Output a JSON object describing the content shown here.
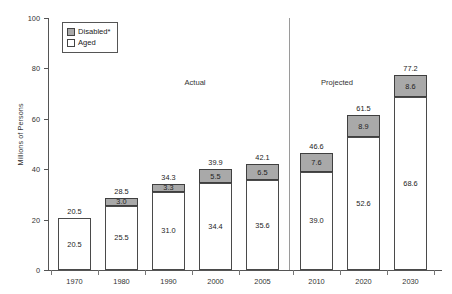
{
  "chart_data": {
    "type": "bar",
    "subtype": "stacked-bar",
    "title": "",
    "xlabel": "",
    "ylabel": "Millions of Persons",
    "ylim": [
      0,
      100
    ],
    "yticks": [
      0,
      20,
      40,
      60,
      80,
      100
    ],
    "grid": false,
    "categories": [
      "1970",
      "1980",
      "1990",
      "2000",
      "2005",
      "2010",
      "2020",
      "2030"
    ],
    "series": [
      {
        "name": "Aged",
        "color": "#ffffff",
        "values": [
          20.5,
          25.5,
          31.0,
          34.4,
          35.6,
          39.0,
          52.6,
          68.6
        ]
      },
      {
        "name": "Disabled*",
        "color": "#a9a9a9",
        "values": [
          null,
          3.0,
          3.3,
          5.5,
          6.5,
          7.6,
          8.9,
          8.6
        ]
      }
    ],
    "totals": [
      20.5,
      28.5,
      34.3,
      39.9,
      42.1,
      46.6,
      61.5,
      77.2
    ],
    "annotations": [
      {
        "text": "Actual",
        "region": "1970-2005"
      },
      {
        "text": "Projected",
        "region": "2010-2030"
      }
    ],
    "legend": {
      "position": "top-left",
      "entries": [
        {
          "label": "Disabled*",
          "color": "#a9a9a9"
        },
        {
          "label": "Aged",
          "color": "#ffffff"
        }
      ]
    },
    "divider": {
      "between": [
        "2005",
        "2010"
      ],
      "label": "actual-projected-divider"
    }
  },
  "axis": {
    "y_title": "Millions of Persons",
    "y_ticks": [
      "0",
      "20",
      "40",
      "60",
      "80",
      "100"
    ],
    "x_ticks": [
      "1970",
      "1980",
      "1990",
      "2000",
      "2005",
      "2010",
      "2020",
      "2030"
    ]
  },
  "sections": {
    "actual": "Actual",
    "projected": "Projected"
  },
  "legend": {
    "disabled_label": "Disabled*",
    "aged_label": "Aged"
  },
  "bars": [
    {
      "year": "1970",
      "total": "20.5",
      "aged": "20.5",
      "disabled": ""
    },
    {
      "year": "1980",
      "total": "28.5",
      "aged": "25.5",
      "disabled": "3.0"
    },
    {
      "year": "1990",
      "total": "34.3",
      "aged": "31.0",
      "disabled": "3.3"
    },
    {
      "year": "2000",
      "total": "39.9",
      "aged": "34.4",
      "disabled": "5.5"
    },
    {
      "year": "2005",
      "total": "42.1",
      "aged": "35.6",
      "disabled": "6.5"
    },
    {
      "year": "2010",
      "total": "46.6",
      "aged": "39.0",
      "disabled": "7.6"
    },
    {
      "year": "2020",
      "total": "61.5",
      "aged": "52.6",
      "disabled": "8.9"
    },
    {
      "year": "2030",
      "total": "77.2",
      "aged": "68.6",
      "disabled": "8.6"
    }
  ],
  "colors": {
    "disabled_fill": "#a9a9a9",
    "aged_fill": "#ffffff",
    "axis": "#555555",
    "divider": "#9a9a9a"
  }
}
